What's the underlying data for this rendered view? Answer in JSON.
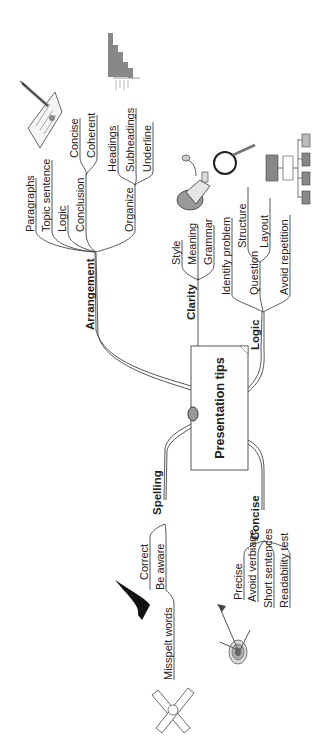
{
  "mindmap": {
    "center": "Presentation tips",
    "branches": {
      "arrangement": {
        "label": "Arrangement",
        "items": [
          "Paragraphs",
          "Topic sentence",
          "Logic",
          "Conclusion",
          "Organize"
        ],
        "conclusion_children": [
          "Concise",
          "Coherent"
        ],
        "organize_children": [
          "Headings",
          "Subheadings",
          "Underline"
        ]
      },
      "clarity": {
        "label": "Clarity",
        "items": [
          "Style",
          "Meaning",
          "Grammar"
        ]
      },
      "logic": {
        "label": "Logic",
        "items": [
          "Identify problem",
          "Question",
          "Avoid repetition"
        ],
        "question_children": [
          "Structure",
          "Layout"
        ]
      },
      "spelling": {
        "label": "Spelling",
        "items": [
          "Correct",
          "Be aware",
          "Misspelt words"
        ]
      },
      "concise": {
        "label": "Concise",
        "items": [
          "Precise",
          "Avoid verbiage",
          "Short sentences",
          "Readability test"
        ]
      }
    },
    "illustrations": [
      "document-pen-icon",
      "bar-chart-icon",
      "megaphone-icon",
      "magnifier-icon",
      "org-chart-icon",
      "checkmark-icon",
      "target-arrows-icon",
      "crossed-bandage-icon"
    ]
  }
}
